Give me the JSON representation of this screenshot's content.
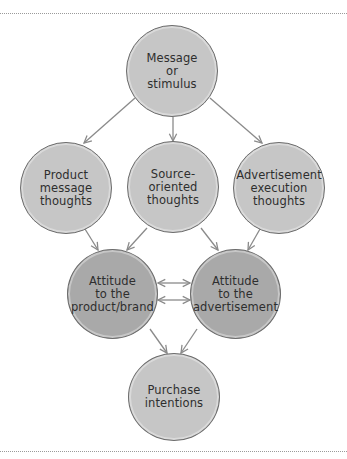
{
  "diagram": {
    "colors": {
      "light_fill": "#c6c6c6",
      "dark_fill": "#a9a9a9",
      "outline": "#6c6c6c",
      "arrow": "#8a8a8a",
      "text": "#2e2e2e"
    },
    "nodes": [
      {
        "id": "message",
        "label": "Message\nor\nstimulus",
        "cx": 172,
        "cy": 71,
        "r": 46,
        "shade": "light"
      },
      {
        "id": "product-thoughts",
        "label": "Product\nmessage\nthoughts",
        "cx": 66,
        "cy": 188,
        "r": 46,
        "shade": "light"
      },
      {
        "id": "source-thoughts",
        "label": "Source-\noriented\nthoughts",
        "cx": 173,
        "cy": 187,
        "r": 46,
        "shade": "light"
      },
      {
        "id": "execution-thoughts",
        "label": "Advertisement\nexecution\nthoughts",
        "cx": 279,
        "cy": 188,
        "r": 46,
        "shade": "light"
      },
      {
        "id": "attitude-brand",
        "label": "Attitude\nto the\nproduct/brand",
        "cx": 112,
        "cy": 294,
        "r": 45,
        "shade": "dark"
      },
      {
        "id": "attitude-ad",
        "label": "Attitude\nto the\nadvertisement",
        "cx": 235,
        "cy": 294,
        "r": 45,
        "shade": "dark"
      },
      {
        "id": "purchase",
        "label": "Purchase\nintentions",
        "cx": 174,
        "cy": 397,
        "r": 45,
        "shade": "light"
      }
    ],
    "edges": [
      {
        "from": "message",
        "to": "product-thoughts",
        "type": "arrow"
      },
      {
        "from": "message",
        "to": "source-thoughts",
        "type": "arrow"
      },
      {
        "from": "message",
        "to": "execution-thoughts",
        "type": "arrow"
      },
      {
        "from": "product-thoughts",
        "to": "attitude-brand",
        "type": "arrow"
      },
      {
        "from": "source-thoughts",
        "to": "attitude-brand",
        "type": "arrow"
      },
      {
        "from": "source-thoughts",
        "to": "attitude-ad",
        "type": "arrow"
      },
      {
        "from": "execution-thoughts",
        "to": "attitude-ad",
        "type": "arrow"
      },
      {
        "from": "attitude-brand",
        "to": "attitude-ad",
        "type": "bidirectional"
      },
      {
        "from": "attitude-ad",
        "to": "attitude-brand",
        "type": "bidirectional"
      },
      {
        "from": "attitude-brand",
        "to": "purchase",
        "type": "arrow"
      },
      {
        "from": "attitude-ad",
        "to": "purchase",
        "type": "arrow"
      }
    ]
  }
}
